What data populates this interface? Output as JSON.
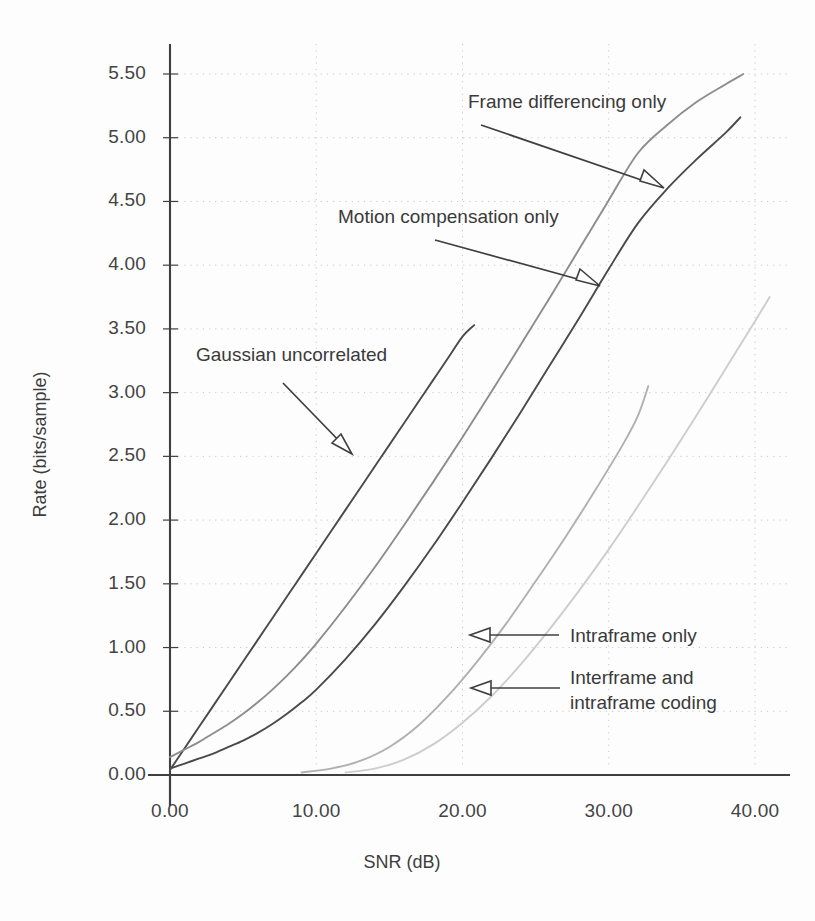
{
  "chart_data": {
    "type": "line",
    "title": "",
    "xlabel": "SNR (dB)",
    "ylabel": "Rate (bits/sample)",
    "xlim": [
      0,
      41
    ],
    "ylim": [
      0,
      5.75
    ],
    "grid": true,
    "grid_style": "dotted",
    "legend": "annotations-with-arrows",
    "xticks": [
      "0.00",
      "10.00",
      "20.00",
      "30.00",
      "40.00"
    ],
    "xtick_values": [
      0,
      10,
      20,
      30,
      40
    ],
    "yticks": [
      "0.00",
      "0.50",
      "1.00",
      "1.50",
      "2.00",
      "2.50",
      "3.00",
      "3.50",
      "4.00",
      "4.50",
      "5.00",
      "5.50"
    ],
    "ytick_values": [
      0,
      0.5,
      1.0,
      1.5,
      2.0,
      2.5,
      3.0,
      3.5,
      4.0,
      4.5,
      5.0,
      5.5
    ],
    "series": [
      {
        "name": "Gaussian uncorrelated",
        "color": "#4a4a4a",
        "points": [
          [
            0.0,
            0.04
          ],
          [
            1.0,
            0.21
          ],
          [
            2.0,
            0.38
          ],
          [
            3.0,
            0.55
          ],
          [
            4.0,
            0.72
          ],
          [
            5.0,
            0.89
          ],
          [
            6.0,
            1.06
          ],
          [
            7.0,
            1.23
          ],
          [
            8.0,
            1.4
          ],
          [
            9.0,
            1.57
          ],
          [
            10.0,
            1.74
          ],
          [
            11.0,
            1.91
          ],
          [
            12.0,
            2.08
          ],
          [
            13.0,
            2.25
          ],
          [
            14.0,
            2.42
          ],
          [
            15.0,
            2.59
          ],
          [
            16.0,
            2.76
          ],
          [
            17.0,
            2.93
          ],
          [
            18.0,
            3.1
          ],
          [
            19.0,
            3.27
          ],
          [
            20.0,
            3.44
          ],
          [
            20.8,
            3.53
          ]
        ]
      },
      {
        "name": "Frame differencing only",
        "color": "#8d8d8d",
        "points": [
          [
            0.0,
            0.14
          ],
          [
            1.0,
            0.2
          ],
          [
            2.0,
            0.26
          ],
          [
            3.0,
            0.33
          ],
          [
            4.0,
            0.4
          ],
          [
            5.0,
            0.48
          ],
          [
            6.0,
            0.57
          ],
          [
            7.0,
            0.67
          ],
          [
            8.0,
            0.78
          ],
          [
            9.0,
            0.9
          ],
          [
            10.0,
            1.03
          ],
          [
            12.0,
            1.32
          ],
          [
            14.0,
            1.63
          ],
          [
            16.0,
            1.96
          ],
          [
            18.0,
            2.3
          ],
          [
            20.0,
            2.65
          ],
          [
            22.0,
            3.01
          ],
          [
            24.0,
            3.38
          ],
          [
            26.0,
            3.75
          ],
          [
            28.0,
            4.13
          ],
          [
            30.0,
            4.51
          ],
          [
            32.0,
            4.88
          ],
          [
            34.0,
            5.1
          ],
          [
            36.0,
            5.28
          ],
          [
            38.0,
            5.42
          ],
          [
            39.2,
            5.5
          ]
        ]
      },
      {
        "name": "Motion compensation only",
        "color": "#4a4a4a",
        "points": [
          [
            0.0,
            0.05
          ],
          [
            1.0,
            0.09
          ],
          [
            2.0,
            0.13
          ],
          [
            3.0,
            0.17
          ],
          [
            4.0,
            0.22
          ],
          [
            5.0,
            0.27
          ],
          [
            6.0,
            0.33
          ],
          [
            7.0,
            0.4
          ],
          [
            8.0,
            0.48
          ],
          [
            9.0,
            0.57
          ],
          [
            10.0,
            0.67
          ],
          [
            12.0,
            0.91
          ],
          [
            14.0,
            1.18
          ],
          [
            16.0,
            1.48
          ],
          [
            18.0,
            1.8
          ],
          [
            20.0,
            2.14
          ],
          [
            22.0,
            2.49
          ],
          [
            24.0,
            2.85
          ],
          [
            26.0,
            3.22
          ],
          [
            28.0,
            3.59
          ],
          [
            30.0,
            3.97
          ],
          [
            32.0,
            4.33
          ],
          [
            34.0,
            4.6
          ],
          [
            36.0,
            4.83
          ],
          [
            38.0,
            5.04
          ],
          [
            39.0,
            5.16
          ]
        ]
      },
      {
        "name": "Intraframe only",
        "color": "#b0b0b0",
        "points": [
          [
            9.0,
            0.02
          ],
          [
            11.0,
            0.05
          ],
          [
            13.0,
            0.11
          ],
          [
            15.0,
            0.22
          ],
          [
            17.0,
            0.39
          ],
          [
            19.0,
            0.62
          ],
          [
            21.0,
            0.89
          ],
          [
            23.0,
            1.19
          ],
          [
            25.0,
            1.52
          ],
          [
            27.0,
            1.86
          ],
          [
            29.0,
            2.22
          ],
          [
            31.0,
            2.6
          ],
          [
            32.0,
            2.82
          ],
          [
            32.7,
            3.05
          ]
        ]
      },
      {
        "name": "Interframe and intraframe coding",
        "color": "#cdcdcd",
        "points": [
          [
            12.0,
            0.02
          ],
          [
            14.0,
            0.05
          ],
          [
            16.0,
            0.12
          ],
          [
            18.0,
            0.24
          ],
          [
            20.0,
            0.41
          ],
          [
            22.0,
            0.62
          ],
          [
            24.0,
            0.87
          ],
          [
            26.0,
            1.15
          ],
          [
            28.0,
            1.45
          ],
          [
            30.0,
            1.77
          ],
          [
            32.0,
            2.11
          ],
          [
            34.0,
            2.46
          ],
          [
            36.0,
            2.82
          ],
          [
            38.0,
            3.19
          ],
          [
            40.0,
            3.56
          ],
          [
            41.0,
            3.75
          ]
        ]
      }
    ]
  },
  "annotations": [
    {
      "id": "frame-differencing",
      "text": "Frame differencing only"
    },
    {
      "id": "motion-compensation",
      "text": "Motion compensation only"
    },
    {
      "id": "gaussian-uncorrelated",
      "text": "Gaussian uncorrelated"
    },
    {
      "id": "intraframe-only",
      "text": "Intraframe only"
    },
    {
      "id": "interframe-line1",
      "text": "Interframe and"
    },
    {
      "id": "interframe-line2",
      "text": "intraframe coding"
    }
  ],
  "colors": {
    "axis": "#3f3f3f",
    "grid": "#c8c8c8",
    "text": "#3a3a3a",
    "curve_dark": "#4a4a4a",
    "curve_mid": "#8d8d8d",
    "curve_light": "#b0b0b0",
    "curve_faint": "#cdcdcd"
  }
}
